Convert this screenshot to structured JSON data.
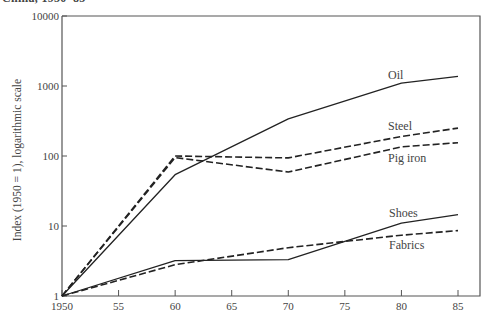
{
  "caption": "China, 1950–85",
  "chart_data": {
    "type": "line",
    "title": "China, 1950–85",
    "xlabel": "",
    "ylabel": "Index (1950 = 1), logarithmic scale",
    "yscale": "log",
    "ylim": [
      1,
      10000
    ],
    "xlim": [
      1950,
      1987
    ],
    "x": [
      1950,
      1960,
      1970,
      1980,
      1985
    ],
    "xticks": [
      1950,
      1955,
      1960,
      1965,
      1970,
      1975,
      1980,
      1985
    ],
    "xtick_labels": [
      "1950",
      "55",
      "60",
      "65",
      "70",
      "75",
      "80",
      "85"
    ],
    "yticks": [
      1,
      10,
      100,
      1000,
      10000
    ],
    "ytick_labels": [
      "1",
      "10",
      "100",
      "1000",
      "10000"
    ],
    "grid": false,
    "legend": "inline labels at line ends",
    "series": [
      {
        "name": "Oil",
        "style": "solid",
        "values": [
          1,
          54,
          340,
          1100,
          1370
        ]
      },
      {
        "name": "Steel",
        "style": "dashed",
        "values": [
          1,
          100,
          94,
          190,
          250
        ]
      },
      {
        "name": "Pig iron",
        "style": "dashed",
        "values": [
          1,
          95,
          59,
          135,
          155
        ]
      },
      {
        "name": "Shoes",
        "style": "solid",
        "values": [
          1,
          3.2,
          3.3,
          11,
          14.5
        ]
      },
      {
        "name": "Fabrics",
        "style": "dashed",
        "values": [
          1,
          2.8,
          4.9,
          7.4,
          8.6
        ]
      }
    ],
    "labels": [
      {
        "text": "Oil",
        "x": 388,
        "y": 79
      },
      {
        "text": "Steel",
        "x": 388,
        "y": 130
      },
      {
        "text": "Pig iron",
        "x": 388,
        "y": 162
      },
      {
        "text": "Shoes",
        "x": 389,
        "y": 217
      },
      {
        "text": "Fabrics",
        "x": 389,
        "y": 249
      }
    ]
  },
  "colors": {
    "line": "#222222",
    "axis": "#555555",
    "text": "#444444"
  }
}
